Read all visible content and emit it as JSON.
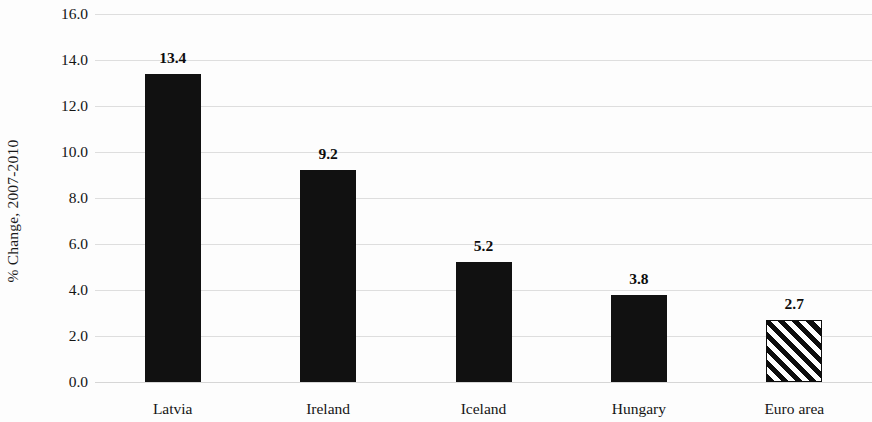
{
  "chart_data": {
    "type": "bar",
    "title": "",
    "subtitle": "",
    "xlabel": "",
    "ylabel": "% Change, 2007-2010",
    "categories": [
      "Latvia",
      "Ireland",
      "Iceland",
      "Hungary",
      "Euro area"
    ],
    "values": [
      13.4,
      9.2,
      5.2,
      3.8,
      2.7
    ],
    "value_labels": [
      "13.4",
      "9.2",
      "5.2",
      "3.8",
      "2.7"
    ],
    "ylim": [
      0.0,
      16.0
    ],
    "ytick_step": 2.0,
    "ytick_labels": [
      "16.0",
      "14.0",
      "12.0",
      "10.0",
      "8.0",
      "6.0",
      "4.0",
      "2.0",
      "0.0"
    ],
    "ytick_values": [
      16.0,
      14.0,
      12.0,
      10.0,
      8.0,
      6.0,
      4.0,
      2.0,
      0.0
    ],
    "grid": true,
    "grid_orientation": "horizontal",
    "legend": false,
    "legend_position": "none",
    "bar_styles": [
      "solid",
      "solid",
      "solid",
      "solid",
      "hatched-diagonal"
    ],
    "colors": {
      "bar_fill": "#111111",
      "hatch_stroke": "#0d0d0d",
      "hatch_background": "#ffffff",
      "gridline": "#d8d8d8",
      "text": "#141414",
      "background": "#fdfdfd"
    }
  }
}
